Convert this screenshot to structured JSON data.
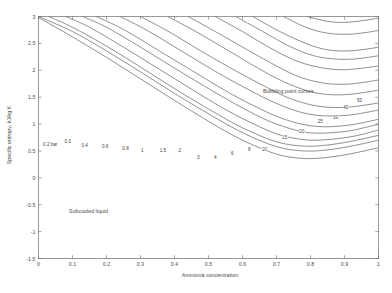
{
  "chart_data": {
    "type": "line",
    "title": "",
    "xlabel": "Ammonia concentration",
    "ylabel": "Specific entropy, kJ/kg K",
    "xlim": [
      0,
      1
    ],
    "ylim": [
      -1.5,
      3
    ],
    "xticks": [
      "0",
      "0.1",
      "0.2",
      "0.3",
      "0.4",
      "0.5",
      "0.6",
      "0.7",
      "0.8",
      "0.9",
      "1"
    ],
    "yticks": [
      "3",
      "2.5",
      "2",
      "1.5",
      "1",
      "0.5",
      "0",
      "-0.5",
      "-1",
      "-1.5"
    ],
    "grid": false,
    "legend": "none",
    "annotations": [
      {
        "text": "Bubbling point curves",
        "x": 0.66,
        "y": 1.62
      },
      {
        "text": "Subcooled liquid",
        "x": 0.09,
        "y": -0.62
      }
    ],
    "series_label_unit": "bar",
    "series": [
      {
        "name": "0.2",
        "label": "0.2 bar",
        "label_x": 0.012,
        "label_y": 0.62,
        "values": [
          [
            0,
            2.98
          ],
          [
            0.1,
            2.62
          ],
          [
            0.2,
            2.24
          ],
          [
            0.3,
            1.84
          ],
          [
            0.4,
            1.44
          ],
          [
            0.5,
            1.05
          ],
          [
            0.6,
            0.7
          ],
          [
            0.7,
            0.44
          ],
          [
            0.78,
            0.36
          ],
          [
            0.85,
            0.38
          ],
          [
            0.92,
            0.45
          ],
          [
            1,
            0.56
          ]
        ]
      },
      {
        "name": "0.3",
        "label": "0.3",
        "label_x": 0.075,
        "label_y": 0.68,
        "values": [
          [
            0,
            3.0
          ],
          [
            0.1,
            2.72
          ],
          [
            0.2,
            2.36
          ],
          [
            0.3,
            1.97
          ],
          [
            0.4,
            1.57
          ],
          [
            0.5,
            1.19
          ],
          [
            0.6,
            0.84
          ],
          [
            0.7,
            0.58
          ],
          [
            0.78,
            0.5
          ],
          [
            0.85,
            0.52
          ],
          [
            0.92,
            0.59
          ],
          [
            1,
            0.7
          ]
        ]
      },
      {
        "name": "0.4",
        "label": "0.4",
        "label_x": 0.125,
        "label_y": 0.6,
        "values": [
          [
            0.03,
            3.0
          ],
          [
            0.1,
            2.8
          ],
          [
            0.2,
            2.45
          ],
          [
            0.3,
            2.06
          ],
          [
            0.4,
            1.66
          ],
          [
            0.5,
            1.28
          ],
          [
            0.6,
            0.93
          ],
          [
            0.7,
            0.67
          ],
          [
            0.78,
            0.59
          ],
          [
            0.85,
            0.61
          ],
          [
            0.92,
            0.68
          ],
          [
            1,
            0.79
          ]
        ]
      },
      {
        "name": "0.6",
        "label": "0.6",
        "label_x": 0.185,
        "label_y": 0.58,
        "values": [
          [
            0.08,
            3.0
          ],
          [
            0.15,
            2.8
          ],
          [
            0.25,
            2.43
          ],
          [
            0.35,
            2.04
          ],
          [
            0.45,
            1.65
          ],
          [
            0.55,
            1.27
          ],
          [
            0.65,
            0.95
          ],
          [
            0.72,
            0.78
          ],
          [
            0.8,
            0.7
          ],
          [
            0.88,
            0.73
          ],
          [
            0.94,
            0.79
          ],
          [
            1,
            0.89
          ]
        ]
      },
      {
        "name": "0.8",
        "label": "0.8",
        "label_x": 0.245,
        "label_y": 0.54,
        "values": [
          [
            0.13,
            3.0
          ],
          [
            0.2,
            2.8
          ],
          [
            0.3,
            2.43
          ],
          [
            0.4,
            2.04
          ],
          [
            0.5,
            1.66
          ],
          [
            0.6,
            1.3
          ],
          [
            0.68,
            1.05
          ],
          [
            0.76,
            0.88
          ],
          [
            0.82,
            0.83
          ],
          [
            0.9,
            0.86
          ],
          [
            0.95,
            0.92
          ],
          [
            1,
            1.0
          ]
        ]
      },
      {
        "name": "1",
        "label": "1",
        "label_x": 0.3,
        "label_y": 0.5,
        "values": [
          [
            0.17,
            3.0
          ],
          [
            0.25,
            2.76
          ],
          [
            0.35,
            2.38
          ],
          [
            0.45,
            2.0
          ],
          [
            0.55,
            1.62
          ],
          [
            0.63,
            1.35
          ],
          [
            0.71,
            1.12
          ],
          [
            0.78,
            0.99
          ],
          [
            0.84,
            0.95
          ],
          [
            0.9,
            0.97
          ],
          [
            0.95,
            1.02
          ],
          [
            1,
            1.09
          ]
        ]
      },
      {
        "name": "1.5",
        "label": "1.5",
        "label_x": 0.355,
        "label_y": 0.5,
        "values": [
          [
            0.24,
            3.0
          ],
          [
            0.32,
            2.74
          ],
          [
            0.42,
            2.36
          ],
          [
            0.52,
            1.98
          ],
          [
            0.6,
            1.7
          ],
          [
            0.68,
            1.44
          ],
          [
            0.75,
            1.26
          ],
          [
            0.81,
            1.17
          ],
          [
            0.87,
            1.15
          ],
          [
            0.93,
            1.18
          ],
          [
            1,
            1.26
          ]
        ]
      },
      {
        "name": "2",
        "label": "2",
        "label_x": 0.41,
        "label_y": 0.5,
        "values": [
          [
            0.3,
            3.0
          ],
          [
            0.38,
            2.73
          ],
          [
            0.48,
            2.35
          ],
          [
            0.58,
            1.99
          ],
          [
            0.66,
            1.72
          ],
          [
            0.73,
            1.5
          ],
          [
            0.8,
            1.36
          ],
          [
            0.86,
            1.31
          ],
          [
            0.92,
            1.32
          ],
          [
            1,
            1.39
          ]
        ]
      },
      {
        "name": "3",
        "label": "3",
        "label_x": 0.465,
        "label_y": 0.38,
        "values": [
          [
            0.38,
            3.0
          ],
          [
            0.46,
            2.73
          ],
          [
            0.56,
            2.36
          ],
          [
            0.64,
            2.06
          ],
          [
            0.72,
            1.79
          ],
          [
            0.79,
            1.62
          ],
          [
            0.85,
            1.55
          ],
          [
            0.91,
            1.55
          ],
          [
            0.96,
            1.59
          ],
          [
            1,
            1.63
          ]
        ]
      },
      {
        "name": "4",
        "label": "4",
        "label_x": 0.515,
        "label_y": 0.37,
        "values": [
          [
            0.44,
            3.0
          ],
          [
            0.52,
            2.72
          ],
          [
            0.62,
            2.36
          ],
          [
            0.7,
            2.08
          ],
          [
            0.77,
            1.87
          ],
          [
            0.84,
            1.76
          ],
          [
            0.9,
            1.74
          ],
          [
            0.95,
            1.77
          ],
          [
            1,
            1.82
          ]
        ]
      },
      {
        "name": "6",
        "label": "6",
        "label_x": 0.565,
        "label_y": 0.46,
        "values": [
          [
            0.52,
            3.0
          ],
          [
            0.6,
            2.72
          ],
          [
            0.68,
            2.42
          ],
          [
            0.76,
            2.17
          ],
          [
            0.83,
            2.05
          ],
          [
            0.89,
            2.01
          ],
          [
            0.94,
            2.03
          ],
          [
            1,
            2.08
          ]
        ]
      },
      {
        "name": "8",
        "label": "8",
        "label_x": 0.615,
        "label_y": 0.52,
        "values": [
          [
            0.58,
            3.0
          ],
          [
            0.66,
            2.72
          ],
          [
            0.74,
            2.44
          ],
          [
            0.81,
            2.27
          ],
          [
            0.87,
            2.21
          ],
          [
            0.93,
            2.21
          ],
          [
            1,
            2.27
          ]
        ]
      },
      {
        "name": "10",
        "label": "10",
        "label_x": 0.655,
        "label_y": 0.53,
        "values": [
          [
            0.63,
            3.0
          ],
          [
            0.71,
            2.72
          ],
          [
            0.79,
            2.49
          ],
          [
            0.85,
            2.38
          ],
          [
            0.91,
            2.36
          ],
          [
            0.96,
            2.39
          ],
          [
            1,
            2.43
          ]
        ]
      },
      {
        "name": "15",
        "label": "15",
        "label_x": 0.715,
        "label_y": 0.75,
        "values": [
          [
            0.72,
            3.0
          ],
          [
            0.79,
            2.79
          ],
          [
            0.85,
            2.69
          ],
          [
            0.91,
            2.67
          ],
          [
            0.96,
            2.7
          ],
          [
            1,
            2.74
          ]
        ]
      },
      {
        "name": "20",
        "label": "20",
        "label_x": 0.765,
        "label_y": 0.86,
        "values": [
          [
            0.79,
            3.0
          ],
          [
            0.85,
            2.91
          ],
          [
            0.9,
            2.89
          ],
          [
            0.95,
            2.92
          ],
          [
            1,
            2.97
          ]
        ]
      },
      {
        "name": "25",
        "label": "25",
        "label_x": 0.82,
        "label_y": 1.05,
        "values": [
          [
            0.84,
            3.08
          ],
          [
            0.89,
            3.05
          ],
          [
            0.94,
            3.07
          ],
          [
            1,
            3.12
          ]
        ]
      },
      {
        "name": "30",
        "label": "30",
        "label_x": 0.865,
        "label_y": 1.12,
        "values": [
          [
            0.88,
            3.2
          ],
          [
            0.93,
            3.2
          ],
          [
            0.97,
            3.23
          ],
          [
            1,
            3.26
          ]
        ]
      },
      {
        "name": "40",
        "label": "40",
        "label_x": 0.895,
        "label_y": 1.3,
        "values": [
          [
            0.9,
            3.4
          ],
          [
            0.95,
            3.42
          ],
          [
            1,
            3.47
          ]
        ]
      },
      {
        "name": "50",
        "label": "50",
        "label_x": 0.935,
        "label_y": 1.43,
        "values": [
          [
            0.93,
            3.58
          ],
          [
            0.97,
            3.61
          ],
          [
            1,
            3.64
          ]
        ]
      }
    ]
  },
  "axes": {
    "xticklabels": [
      "0",
      "0.1",
      "0.2",
      "0.3",
      "0.4",
      "0.5",
      "0.6",
      "0.7",
      "0.8",
      "0.9",
      "1"
    ],
    "yticklabels": [
      "3",
      "2.5",
      "2",
      "1.5",
      "1",
      "0.5",
      "0",
      "-0.5",
      "-1",
      "-1.5"
    ],
    "xlabel": "Ammonia concentration",
    "ylabel": "Specific entropy, kJ/kg K"
  },
  "colors": {
    "background": "#ffffff",
    "axis": "#6d6d6d",
    "curve": "#555555",
    "text": "#4a4a4a"
  }
}
